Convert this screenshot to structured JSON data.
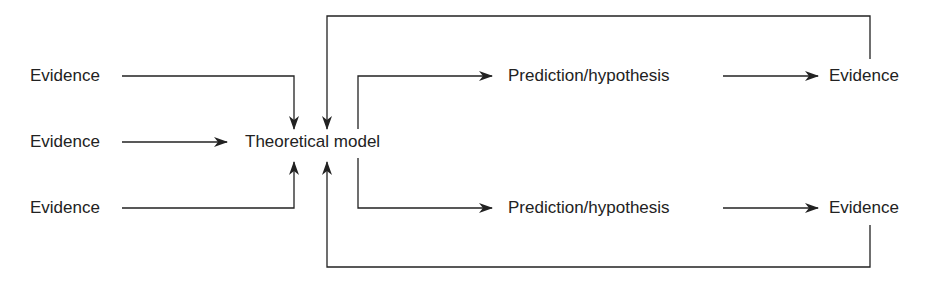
{
  "diagram": {
    "inputs": [
      {
        "label": "Evidence"
      },
      {
        "label": "Evidence"
      },
      {
        "label": "Evidence"
      }
    ],
    "center": {
      "label": "Theoretical model"
    },
    "branches": [
      {
        "prediction": "Prediction/hypothesis",
        "evidence": "Evidence"
      },
      {
        "prediction": "Prediction/hypothesis",
        "evidence": "Evidence"
      }
    ],
    "colors": {
      "line": "#222222",
      "text": "#222222",
      "background": "#ffffff"
    }
  }
}
